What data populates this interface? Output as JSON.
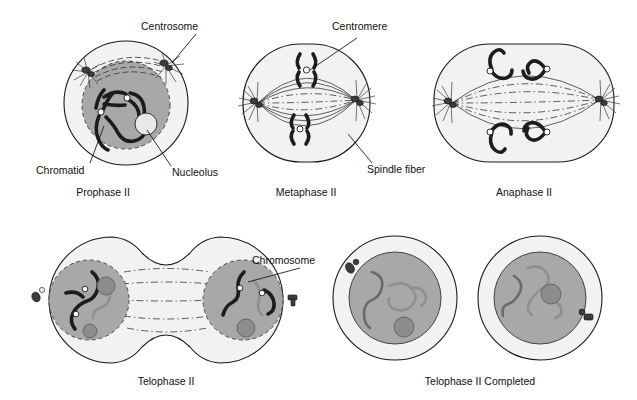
{
  "figure": {
    "colors": {
      "cell_membrane_fill": "#f2f2f2",
      "cytoplasm_fill": "#ececec",
      "nucleus_fill": "#a8a8a8",
      "nucleolus_fill": "#8c8c8c",
      "chromosome_dark": "#1c1c1c",
      "chromosome_light": "#8f8f8f",
      "centromere": "#ffffff",
      "outline": "#1a1a1a",
      "text": "#111111",
      "background": "#ffffff"
    }
  },
  "panels": [
    {
      "id": "prophase-2",
      "stage_label": "Prophase II"
    },
    {
      "id": "metaphase-2",
      "stage_label": "Metaphase II"
    },
    {
      "id": "anaphase-2",
      "stage_label": "Anaphase II"
    },
    {
      "id": "telophase-2",
      "stage_label": "Telophase II"
    },
    {
      "id": "telophase-2-completed",
      "stage_label": "Telophase II Completed"
    }
  ],
  "annotations": {
    "centrosome": "Centrosome",
    "chromatid": "Chromatid",
    "nucleolus": "Nucleolus",
    "centromere": "Centromere",
    "spindle_fiber": "Spindle fiber",
    "chromosome": "Chromosome"
  },
  "icons": {
    "centrosome": "centrosome-icon",
    "aster": "aster-icon",
    "chromosome": "chromosome-icon",
    "nucleolus": "nucleolus-icon",
    "spindle": "spindle-fiber-icon"
  }
}
